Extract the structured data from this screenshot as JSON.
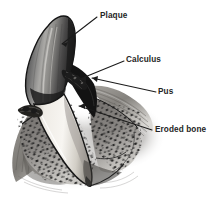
{
  "figure": {
    "style": "grayscale pen-and-ink medical illustration",
    "background_color": "#ffffff",
    "ink_color": "#1c1c1c",
    "labels": [
      {
        "id": "plaque",
        "text": "Plaque",
        "text_x": 100,
        "text_y": 11,
        "leader_from": [
          97,
          17
        ],
        "leader_to": [
          62,
          44
        ]
      },
      {
        "id": "calculus",
        "text": "Calculus",
        "text_x": 126,
        "text_y": 55,
        "leader_from": [
          124,
          61
        ],
        "leader_to": [
          80,
          79
        ]
      },
      {
        "id": "pus",
        "text": "Pus",
        "text_x": 158,
        "text_y": 87,
        "leader_from": [
          156,
          92
        ],
        "leader_to": [
          92,
          78
        ]
      },
      {
        "id": "eroded-bone",
        "text": "Eroded bone",
        "text_x": 155,
        "text_y": 125,
        "leader_from": [
          152,
          130
        ],
        "leader_to": [
          79,
          106
        ]
      }
    ],
    "parts": [
      {
        "id": "tooth-crown",
        "name": "tooth crown with plaque",
        "shade": "#4a4a4a"
      },
      {
        "id": "tooth-root",
        "name": "exposed tooth root",
        "shade": "#e8e6e2"
      },
      {
        "id": "calculus-deposit",
        "name": "calculus deposit at gumline",
        "shade": "#2a2a2a"
      },
      {
        "id": "pus-pocket",
        "name": "periodontal pocket with pus",
        "shade": "#141414"
      },
      {
        "id": "gum-tissue",
        "name": "gingival tissue",
        "shade": "#8d8a86"
      },
      {
        "id": "eroded-bone-area",
        "name": "eroded alveolar bone, stippled",
        "shade": "#6e6b68"
      }
    ],
    "edge_artifact_color": "#b9b9b9"
  }
}
